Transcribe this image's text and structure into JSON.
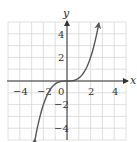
{
  "chart_data": {
    "type": "line",
    "title": "",
    "xlabel": "x",
    "ylabel": "y",
    "xlim": [
      -5,
      5
    ],
    "ylim": [
      -5,
      5
    ],
    "grid": true,
    "grid_step": 1,
    "xticks": [
      -4,
      -2,
      0,
      2,
      4
    ],
    "yticks": [
      -4,
      -2,
      2,
      4
    ],
    "xtick_labels": [
      "-4",
      "-2",
      "0",
      "2",
      "4"
    ],
    "ytick_labels": [
      "-4",
      "-2",
      "2",
      "4"
    ],
    "series": [
      {
        "name": "y = x^3/4",
        "x": [
          -2.7,
          -2,
          -1.5,
          -1,
          -0.5,
          0,
          0.5,
          1,
          1.5,
          2,
          2.7
        ],
        "y": [
          -4.92,
          -2,
          -0.84,
          -0.25,
          -0.03,
          0,
          0.03,
          0.25,
          0.84,
          2,
          4.92
        ],
        "arrows": "both"
      }
    ],
    "colors": {
      "grid": "#d8d8d8",
      "axis": "#333333",
      "curve": "#555555"
    }
  },
  "labels": {
    "x_axis": "x",
    "y_axis": "y",
    "xtick": [
      "−4",
      "−2",
      "0",
      "2",
      "4"
    ],
    "ytick": [
      "4",
      "2",
      "−2",
      "−4"
    ]
  }
}
